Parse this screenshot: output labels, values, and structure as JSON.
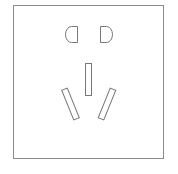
{
  "figure": {
    "title": "Power outlet (socket) line drawing",
    "stroke_color": "#777777",
    "background_color": "#ffffff",
    "frame": {
      "x": 13,
      "y": 5,
      "width": 150,
      "height": 153
    },
    "two_pin_slots": [
      {
        "name": "left-pin-slot",
        "shape": "D-half-round",
        "flat_side": "right",
        "x": 65,
        "y": 26,
        "width": 12,
        "height": 16
      },
      {
        "name": "right-pin-slot",
        "shape": "D-half-round",
        "flat_side": "left",
        "x": 100,
        "y": 26,
        "width": 12,
        "height": 16
      }
    ],
    "three_pin_slots": [
      {
        "name": "earth-slot",
        "shape": "rectangle",
        "orientation": "vertical",
        "x": 85,
        "y": 63,
        "width": 6,
        "height": 32
      },
      {
        "name": "live-slot",
        "shape": "rectangle",
        "orientation": "angled-left",
        "angle_deg": -22
      },
      {
        "name": "neutral-slot",
        "shape": "rectangle",
        "orientation": "angled-right",
        "angle_deg": 22
      }
    ]
  }
}
